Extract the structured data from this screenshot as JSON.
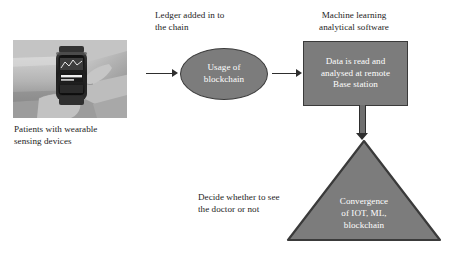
{
  "diagram": {
    "background_color": "#ffffff",
    "shape_fill": "#7c7c7c",
    "shape_stroke": "#3a3a3a",
    "shape_text_color": "#ffffff",
    "body_text_color": "#1c1c1c",
    "connector_color": "#2e2e2e"
  },
  "photo": {
    "alt": "Grayscale photo of a person holding a wrist-worn smart wearable device",
    "caption_line1": "Patients with wearable",
    "caption_line2": "sensing devices"
  },
  "labels": {
    "ledger_line1": "Ledger added in to",
    "ledger_line2": "the chain",
    "ml_line1": "Machine learning",
    "ml_line2": "analytical software",
    "decide_line1": "Decide whether to see",
    "decide_line2": "the doctor or not"
  },
  "nodes": {
    "ellipse": {
      "shape": "ellipse",
      "line1": "Usage of",
      "line2": "blockchain"
    },
    "rectangle": {
      "shape": "rectangle",
      "line1": "Data is read and",
      "line2": "analysed at remote",
      "line3": "Base station"
    },
    "triangle": {
      "shape": "triangle",
      "line1": "Convergence",
      "line2": "of IOT, ML,",
      "line3": "blockchain"
    }
  },
  "connectors": [
    {
      "name": "photo-to-ellipse",
      "direction": "right"
    },
    {
      "name": "ellipse-to-rectangle",
      "direction": "right"
    },
    {
      "name": "rectangle-to-triangle",
      "direction": "down"
    }
  ]
}
